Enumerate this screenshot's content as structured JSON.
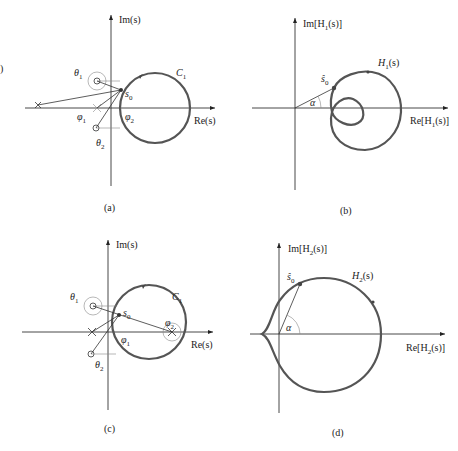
{
  "figure": {
    "edge_fragment": ")",
    "panels": [
      {
        "id": "a",
        "caption": "(a)",
        "im_axis_label": "Im(s)",
        "re_axis_label": "Re(s)",
        "contour_label": "C",
        "contour_sub": "1",
        "point_label": "s",
        "point_sub": "0",
        "angle_labels": [
          {
            "sym": "θ",
            "sub": "1"
          },
          {
            "sym": "φ",
            "sub": "1"
          },
          {
            "sym": "φ",
            "sub": "2"
          },
          {
            "sym": "θ",
            "sub": "2"
          }
        ]
      },
      {
        "id": "b",
        "caption": "(b)",
        "im_axis_label": "Im[H",
        "im_axis_sub": "1",
        "im_axis_tail": "(s)]",
        "re_axis_label": "Re[H",
        "re_axis_sub": "1",
        "re_axis_tail": "(s)]",
        "curve_label": "H",
        "curve_sub": "1",
        "curve_tail": "(s)",
        "point_label": "ŝ",
        "point_sub": "0",
        "angle_label": "α"
      },
      {
        "id": "c",
        "caption": "(c)",
        "im_axis_label": "Im(s)",
        "re_axis_label": "Re(s)",
        "contour_label": "C",
        "contour_sub": "1",
        "point_label": "s",
        "point_sub": "0",
        "angle_labels": [
          {
            "sym": "θ",
            "sub": "1"
          },
          {
            "sym": "φ",
            "sub": "2"
          },
          {
            "sym": "φ",
            "sub": "1"
          },
          {
            "sym": "θ",
            "sub": "2"
          }
        ]
      },
      {
        "id": "d",
        "caption": "(d)",
        "im_axis_label": "Im[H",
        "im_axis_sub": "2",
        "im_axis_tail": "(s)]",
        "re_axis_label": "Re[H",
        "re_axis_sub": "2",
        "re_axis_tail": "(s)]",
        "curve_label": "H",
        "curve_sub": "2",
        "curve_tail": "(s)",
        "point_label": "ŝ",
        "point_sub": "0",
        "angle_label": "α"
      }
    ]
  },
  "colors": {
    "curve": "#555555",
    "axis": "#333333",
    "background": "#ffffff"
  }
}
